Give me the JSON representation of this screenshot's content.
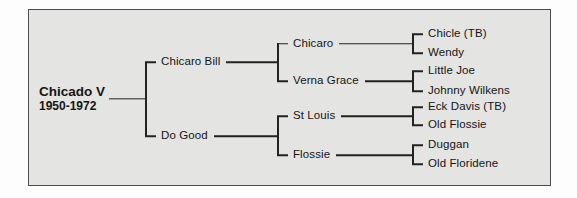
{
  "pedigree": {
    "title": "Chicado V pedigree chart",
    "root": {
      "label": "Chicado V",
      "years": "1950-1972",
      "children": [
        {
          "label": "Chicaro Bill",
          "children": [
            {
              "label": "Chicaro",
              "children": [
                {
                  "label": "Chicle (TB)"
                },
                {
                  "label": "Wendy"
                }
              ]
            },
            {
              "label": "Verna Grace",
              "children": [
                {
                  "label": "Little Joe"
                },
                {
                  "label": "Johnny Wilkens"
                }
              ]
            }
          ]
        },
        {
          "label": "Do Good",
          "children": [
            {
              "label": "St Louis",
              "children": [
                {
                  "label": "Eck Davis (TB)"
                },
                {
                  "label": "Old Flossie"
                }
              ]
            },
            {
              "label": "Flossie",
              "children": [
                {
                  "label": "Duggan"
                },
                {
                  "label": "Old Floridene"
                }
              ]
            }
          ]
        }
      ]
    },
    "colors": {
      "panel_bg": "#e4e4e2",
      "panel_border": "#4d4d4d",
      "line": "#222222",
      "text": "#141414"
    }
  }
}
